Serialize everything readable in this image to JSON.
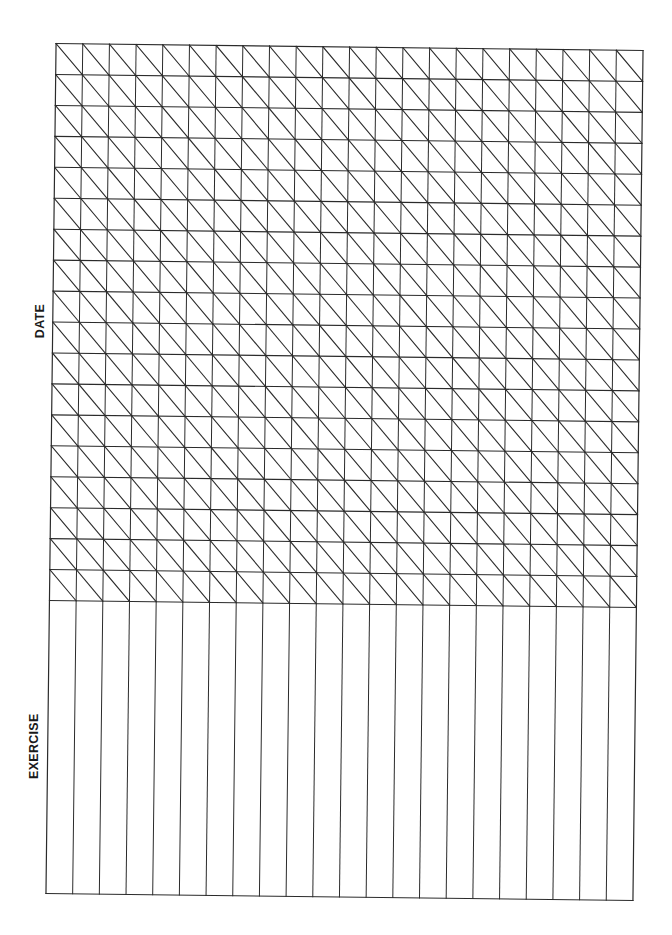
{
  "page": {
    "type": "exercise log form",
    "labels": {
      "date": "DATE",
      "exercise": "EXERCISE"
    }
  },
  "grid": {
    "columns": 22,
    "date_rows": 18,
    "width": 587,
    "date_section_height": 557,
    "exercise_section_height": 293,
    "line_color": "#2b2b2b",
    "diagonal_direction": "top-left-to-bottom-right"
  }
}
